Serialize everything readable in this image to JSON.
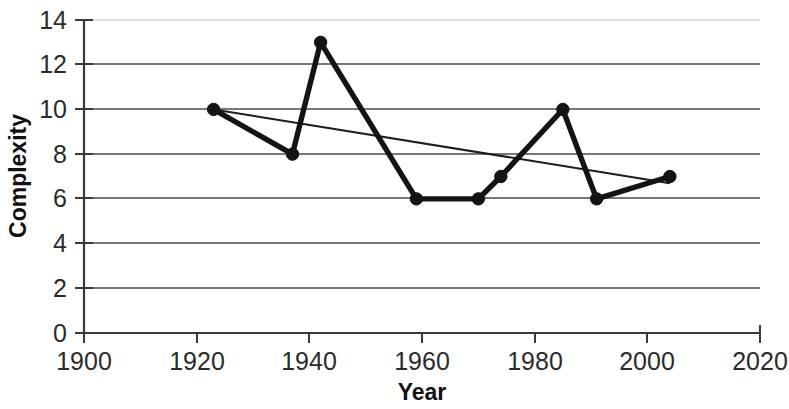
{
  "chart_data": {
    "type": "line",
    "title": "",
    "xlabel": "Year",
    "ylabel": "Complexity",
    "xlim": [
      1900,
      2020
    ],
    "ylim": [
      0,
      14
    ],
    "grid": true,
    "legend": "none",
    "x_ticks": [
      "1900",
      "1920",
      "1940",
      "1960",
      "1980",
      "2000",
      "2020"
    ],
    "y_ticks": [
      "0",
      "2",
      "4",
      "6",
      "8",
      "10",
      "12",
      "14"
    ],
    "series": [
      {
        "name": "Complexity",
        "style": "thick-line-with-markers",
        "x": [
          1923,
          1937,
          1942,
          1959,
          1970,
          1974,
          1985,
          1991,
          2004
        ],
        "values": [
          10,
          8,
          13,
          6,
          6,
          7,
          10,
          6,
          7
        ]
      },
      {
        "name": "Linear trend",
        "style": "thin-line",
        "x": [
          1923,
          2004
        ],
        "values": [
          10,
          6.7
        ]
      }
    ]
  },
  "axes": {
    "y_axis_title": "Complexity",
    "x_axis_title": "Year"
  }
}
